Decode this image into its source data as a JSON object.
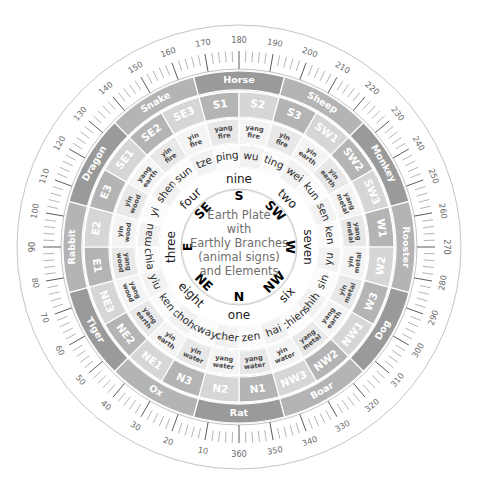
{
  "diagram": {
    "title_lines": [
      "Earth Plate",
      "with",
      "Earthly Branches",
      "(animal signs)",
      "and Elements"
    ],
    "kind": "feng-shui-luopan-earth-plate",
    "colors": {
      "sector_dark": "#9a9a9a",
      "sector_mid": "#b4b4b4",
      "sector_light": "#d6d6d6",
      "sector_pale": "#e8e8e8",
      "outline": "#b5b5b5",
      "text_dark": "#2b2b2b",
      "text_light": "#ffffff",
      "center_text": "#6e6e6e",
      "background": "#ffffff"
    },
    "orientation_note": "180 degrees at top, degrees increase clockwise"
  },
  "degree_ring": {
    "labels": [
      10,
      20,
      30,
      40,
      50,
      60,
      70,
      80,
      90,
      100,
      110,
      120,
      130,
      140,
      150,
      160,
      170,
      180,
      190,
      200,
      210,
      220,
      230,
      240,
      250,
      260,
      270,
      280,
      290,
      300,
      310,
      320,
      330,
      340,
      350,
      360
    ],
    "minor_step": 2,
    "major_step": 10
  },
  "animal_ring": {
    "name": "chinese-zodiac-animals",
    "items": [
      {
        "label": "Horse",
        "center_deg": 180,
        "span_deg": 30
      },
      {
        "label": "Sheep",
        "center_deg": 210,
        "span_deg": 30
      },
      {
        "label": "Monkey",
        "center_deg": 240,
        "span_deg": 30
      },
      {
        "label": "Rooster",
        "center_deg": 270,
        "span_deg": 30
      },
      {
        "label": "Dog",
        "center_deg": 300,
        "span_deg": 30
      },
      {
        "label": "Boar",
        "center_deg": 330,
        "span_deg": 30
      },
      {
        "label": "Rat",
        "center_deg": 0,
        "span_deg": 30
      },
      {
        "label": "Ox",
        "center_deg": 30,
        "span_deg": 30
      },
      {
        "label": "Tiger",
        "center_deg": 60,
        "span_deg": 30
      },
      {
        "label": "Rabbit",
        "center_deg": 90,
        "span_deg": 30
      },
      {
        "label": "Dragon",
        "center_deg": 120,
        "span_deg": 30
      },
      {
        "label": "Snake",
        "center_deg": 150,
        "span_deg": 30
      }
    ]
  },
  "sector_ring": {
    "name": "24-mountain-sectors",
    "items": [
      {
        "label": "S1",
        "center_deg": 172.5
      },
      {
        "label": "S2",
        "center_deg": 187.5
      },
      {
        "label": "S3",
        "center_deg": 202.5
      },
      {
        "label": "SW1",
        "center_deg": 217.5
      },
      {
        "label": "SW2",
        "center_deg": 232.5
      },
      {
        "label": "SW3",
        "center_deg": 247.5
      },
      {
        "label": "W1",
        "center_deg": 262.5
      },
      {
        "label": "W2",
        "center_deg": 277.5
      },
      {
        "label": "W3",
        "center_deg": 292.5
      },
      {
        "label": "NW1",
        "center_deg": 307.5
      },
      {
        "label": "NW2",
        "center_deg": 322.5
      },
      {
        "label": "NW3",
        "center_deg": 337.5
      },
      {
        "label": "N1",
        "center_deg": 352.5
      },
      {
        "label": "N2",
        "center_deg": 7.5
      },
      {
        "label": "N3",
        "center_deg": 22.5
      },
      {
        "label": "NE1",
        "center_deg": 37.5
      },
      {
        "label": "NE2",
        "center_deg": 52.5
      },
      {
        "label": "NE3",
        "center_deg": 67.5
      },
      {
        "label": "E1",
        "center_deg": 82.5
      },
      {
        "label": "E2",
        "center_deg": 97.5
      },
      {
        "label": "E3",
        "center_deg": 112.5
      },
      {
        "label": "SE1",
        "center_deg": 127.5
      },
      {
        "label": "SE2",
        "center_deg": 142.5
      },
      {
        "label": "SE3",
        "center_deg": 157.5
      }
    ]
  },
  "element_ring": {
    "name": "five-elements-yin-yang",
    "items": [
      {
        "label": "yang fire",
        "center_deg": 172.5
      },
      {
        "label": "yang fire",
        "center_deg": 187.5
      },
      {
        "label": "yin fire",
        "center_deg": 202.5
      },
      {
        "label": "yin earth",
        "center_deg": 217.5
      },
      {
        "label": "yin earth",
        "center_deg": 232.5
      },
      {
        "label": "yang metal",
        "center_deg": 247.5
      },
      {
        "label": "yang metal",
        "center_deg": 262.5
      },
      {
        "label": "yin metal",
        "center_deg": 277.5
      },
      {
        "label": "yin metal",
        "center_deg": 292.5
      },
      {
        "label": "yang earth",
        "center_deg": 307.5
      },
      {
        "label": "yang metal",
        "center_deg": 322.5
      },
      {
        "label": "yin water",
        "center_deg": 337.5
      },
      {
        "label": "yang water",
        "center_deg": 352.5
      },
      {
        "label": "yang water",
        "center_deg": 7.5
      },
      {
        "label": "yin water",
        "center_deg": 22.5
      },
      {
        "label": "yin earth",
        "center_deg": 37.5
      },
      {
        "label": "yang earth",
        "center_deg": 52.5
      },
      {
        "label": "yang wood",
        "center_deg": 67.5
      },
      {
        "label": "yang wood",
        "center_deg": 82.5
      },
      {
        "label": "yin wood",
        "center_deg": 97.5
      },
      {
        "label": "yin wood",
        "center_deg": 112.5
      },
      {
        "label": "yang earth",
        "center_deg": 127.5
      },
      {
        "label": "yin fire",
        "center_deg": 142.5
      },
      {
        "label": "yin fire",
        "center_deg": 157.5
      }
    ]
  },
  "branch_ring": {
    "name": "earthly-branches-syllables",
    "items": [
      {
        "label": "ping",
        "center_deg": 172.5
      },
      {
        "label": "wu",
        "center_deg": 187.5
      },
      {
        "label": "ting",
        "center_deg": 202.5
      },
      {
        "label": "wei",
        "center_deg": 217.5
      },
      {
        "label": "kun",
        "center_deg": 232.5
      },
      {
        "label": "sen",
        "center_deg": 247.5
      },
      {
        "label": "ken",
        "center_deg": 262.5
      },
      {
        "label": "yu",
        "center_deg": 277.5
      },
      {
        "label": "sin",
        "center_deg": 292.5
      },
      {
        "label": "shih",
        "center_deg": 307.5
      },
      {
        "label": "chien",
        "center_deg": 322.5
      },
      {
        "label": "hai",
        "center_deg": 337.5
      },
      {
        "label": "zen",
        "center_deg": 352.5
      },
      {
        "label": "cher",
        "center_deg": 7.5
      },
      {
        "label": "kway",
        "center_deg": 22.5
      },
      {
        "label": "choh",
        "center_deg": 37.5
      },
      {
        "label": "ken",
        "center_deg": 52.5
      },
      {
        "label": "yiu",
        "center_deg": 67.5
      },
      {
        "label": "chia",
        "center_deg": 82.5
      },
      {
        "label": "mau",
        "center_deg": 97.5
      },
      {
        "label": "yi",
        "center_deg": 112.5
      },
      {
        "label": "shen",
        "center_deg": 127.5
      },
      {
        "label": "sun",
        "center_deg": 142.5
      },
      {
        "label": "tze",
        "center_deg": 157.5
      }
    ]
  },
  "number_ring": {
    "name": "lo-shu-numbers",
    "items": [
      {
        "label": "nine",
        "center_deg": 180
      },
      {
        "label": "two",
        "center_deg": 225
      },
      {
        "label": "seven",
        "center_deg": 270
      },
      {
        "label": "six",
        "center_deg": 315
      },
      {
        "label": "one",
        "center_deg": 0
      },
      {
        "label": "eight",
        "center_deg": 45
      },
      {
        "label": "three",
        "center_deg": 90
      },
      {
        "label": "four",
        "center_deg": 135
      }
    ]
  },
  "direction_ring": {
    "name": "cardinal-directions",
    "items": [
      {
        "label": "S",
        "center_deg": 180
      },
      {
        "label": "SW",
        "center_deg": 225
      },
      {
        "label": "W",
        "center_deg": 270
      },
      {
        "label": "NW",
        "center_deg": 315
      },
      {
        "label": "N",
        "center_deg": 0
      },
      {
        "label": "NE",
        "center_deg": 45
      },
      {
        "label": "E",
        "center_deg": 90
      },
      {
        "label": "SE",
        "center_deg": 135
      }
    ]
  }
}
